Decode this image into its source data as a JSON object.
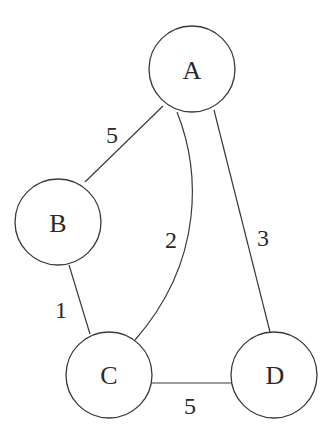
{
  "diagram": {
    "type": "weighted-undirected-graph",
    "colors": {
      "background": "#ffffff",
      "stroke": "#3a3a3a",
      "text": "#2a2a2a"
    },
    "nodes": [
      {
        "id": "A",
        "label": "A",
        "cx": 192,
        "cy": 69,
        "r": 43
      },
      {
        "id": "B",
        "label": "B",
        "cx": 58,
        "cy": 222,
        "r": 43
      },
      {
        "id": "C",
        "label": "C",
        "cx": 109,
        "cy": 375,
        "r": 43
      },
      {
        "id": "D",
        "label": "D",
        "cx": 274,
        "cy": 375,
        "r": 43
      }
    ],
    "edges": [
      {
        "from": "A",
        "to": "B",
        "weight": "5",
        "label_x": 112,
        "label_y": 135
      },
      {
        "from": "A",
        "to": "C",
        "weight": "2",
        "label_x": 171,
        "label_y": 240,
        "curved": true
      },
      {
        "from": "A",
        "to": "D",
        "weight": "3",
        "label_x": 263,
        "label_y": 238
      },
      {
        "from": "B",
        "to": "C",
        "weight": "1",
        "label_x": 61,
        "label_y": 310
      },
      {
        "from": "C",
        "to": "D",
        "weight": "5",
        "label_x": 190,
        "label_y": 406
      }
    ]
  }
}
